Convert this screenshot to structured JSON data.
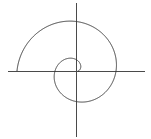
{
  "figure": {
    "background_color": "#ffffff",
    "width": 151,
    "height": 139
  },
  "chart_data": {
    "type": "line",
    "subtitle": "",
    "xlabel": "",
    "ylabel": "",
    "grid": false,
    "legend_position": "none",
    "center": {
      "x": 76,
      "y": 71
    },
    "axes": {
      "x_axis": {
        "from_x": 8,
        "to_x": 145,
        "y": 71,
        "color": "#4a4a4a",
        "width": 1
      },
      "y_axis": {
        "from_y": 3,
        "to_y": 137,
        "x": 76,
        "color": "#4a4a4a",
        "width": 1
      }
    },
    "spiral": {
      "equation": "r = a + b*theta",
      "a_px": 2.0,
      "b_px_per_radian": 6.05,
      "theta_start_rad": 0.0,
      "theta_end_rad": 9.42,
      "turns": 1.5,
      "direction": "counterclockwise-outward-from-center",
      "start_angle_deg": 0,
      "stroke_color": "#3a3a3a",
      "stroke_width": 1
    },
    "axis_crossings": {
      "positive_x_radii_px": [
        12,
        32,
        56
      ],
      "negative_x_radii_px": [
        13,
        32,
        49,
        63
      ],
      "positive_y_radii_px": [
        7,
        19,
        38,
        57
      ],
      "negative_y_radii_px": [
        11,
        29,
        54
      ]
    },
    "series": [
      {
        "name": "spiral",
        "points_polar_deg_px": [
          [
            0,
            2
          ],
          [
            90,
            11.5
          ],
          [
            180,
            21
          ],
          [
            270,
            30.5
          ],
          [
            360,
            40
          ],
          [
            450,
            49.5
          ],
          [
            540,
            59
          ]
        ]
      }
    ],
    "xlim": [
      -68,
      69
    ],
    "ylim": [
      -68,
      66
    ]
  }
}
